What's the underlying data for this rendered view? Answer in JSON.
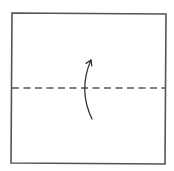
{
  "diagram": {
    "type": "origami-fold-instruction",
    "background": "#ffffff",
    "stroke_color": "#555555",
    "paper": {
      "shape": "square",
      "corners": {
        "top_left": [
          12,
          13
        ],
        "top_right": [
          166,
          14
        ],
        "bottom_right": [
          165,
          164
        ],
        "bottom_left": [
          11,
          163
        ]
      },
      "stroke_width": 1.6
    },
    "fold_line": {
      "kind": "valley-fold",
      "style": "dashed",
      "y": 88,
      "x_start": 12,
      "x_end": 166,
      "dash": [
        7,
        4.5
      ],
      "stroke_width": 1.4
    },
    "fold_arrow": {
      "direction": "up",
      "meaning": "fold bottom half up along dashed line",
      "start": [
        92,
        119
      ],
      "control": [
        78,
        90
      ],
      "end": [
        91,
        60
      ],
      "stroke_width": 1.3
    }
  }
}
